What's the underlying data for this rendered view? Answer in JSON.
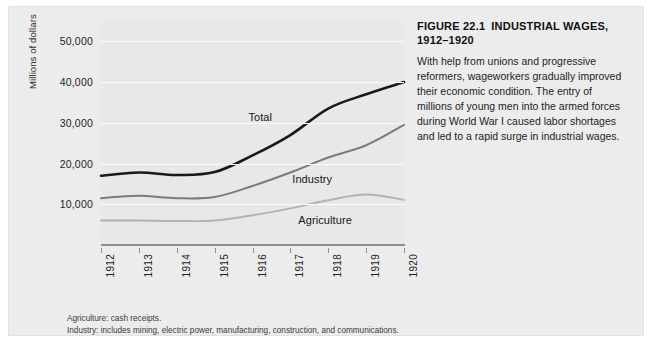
{
  "figure": {
    "number_label": "FIGURE 22.1",
    "title": "INDUSTRIAL WAGES, 1912–1920",
    "caption": "With help from unions and progressive reformers, wageworkers gradually improved their economic condition. The entry of millions of young men into the armed forces during World War I caused labor shortages and led to a rapid surge in industrial wages."
  },
  "footnotes": [
    "Agriculture: cash receipts.",
    "Industry: includes mining, electric power, manufacturing, construction, and communications."
  ],
  "colors": {
    "panel_background": "#ececec",
    "plot_background": "#e8e8e8",
    "gridline": "#fbfbfb",
    "axis": "#8d8d8d",
    "total": "#1a1a1a",
    "industry": "#7b7b7b",
    "agriculture": "#b2b2b2"
  },
  "chart_data": {
    "type": "line",
    "title": "INDUSTRIAL WAGES, 1912–1920",
    "xlabel": "",
    "ylabel": "Millions of dollars",
    "categories": [
      "1912",
      "1913",
      "1914",
      "1915",
      "1916",
      "1917",
      "1918",
      "1919",
      "1920"
    ],
    "x": [
      1912,
      1913,
      1914,
      1915,
      1916,
      1917,
      1918,
      1919,
      1920
    ],
    "ylim": [
      0,
      55000
    ],
    "yticks": [
      10000,
      20000,
      30000,
      40000,
      50000
    ],
    "ytick_labels": [
      "10,000",
      "20,000",
      "30,000",
      "40,000",
      "50,000"
    ],
    "grid": true,
    "legend": "inline-labels",
    "series": [
      {
        "name": "Total",
        "color": "#1a1a1a",
        "values": [
          17000,
          17800,
          17200,
          17900,
          22000,
          27000,
          33500,
          37000,
          40000
        ]
      },
      {
        "name": "Industry",
        "color": "#7b7b7b",
        "values": [
          11500,
          12100,
          11500,
          11800,
          14500,
          17800,
          21500,
          24500,
          29500
        ]
      },
      {
        "name": "Agriculture",
        "color": "#b2b2b2",
        "values": [
          6000,
          6000,
          5900,
          6000,
          7300,
          9000,
          11000,
          12400,
          11100
        ]
      }
    ]
  }
}
